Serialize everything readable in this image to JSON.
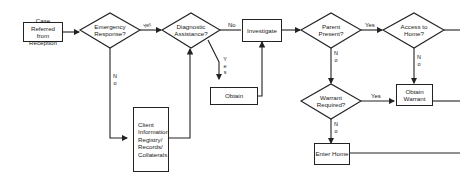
{
  "diagram": {
    "nodes": {
      "case_referred": "Case Referred from Reception",
      "emergency": "Emergency Response?",
      "diagnostic": "Diagnostic Assistance?",
      "investigate": "Investigate",
      "parent_present": "Parent Present?",
      "access_home": "Access to Home?",
      "obtain": "Obtain",
      "client_info": "Client Information Registry/ Records/ Collaterals",
      "warrant_required": "Warrant Required?",
      "obtain_warrant": "Obtain Warrant",
      "enter_home": "Enter Home"
    },
    "edge_labels": {
      "emergency_yes": "Yes",
      "emergency_no": "N\no",
      "diagnostic_no": "No",
      "diagnostic_yes": "Y\ne\ns",
      "parent_yes": "Yes",
      "parent_no": "N\no",
      "access_no": "N\no",
      "warrant_yes": "Yes",
      "warrant_no": "N\no"
    },
    "colors": {
      "line": "#222222",
      "background": "#ffffff"
    }
  }
}
